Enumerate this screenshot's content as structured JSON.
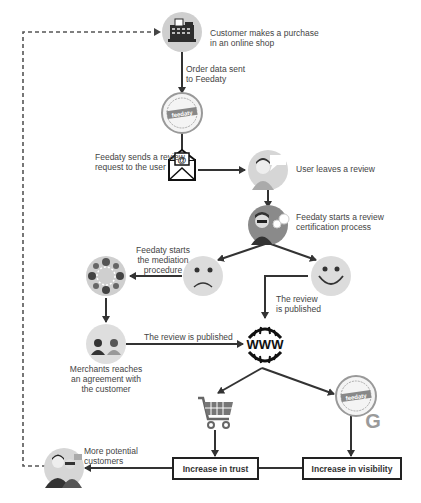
{
  "diagram": {
    "type": "flowchart",
    "nodes": {
      "purchase": {
        "label": "Customer makes a purchase\nin an online shop",
        "icon": "cash-register-icon"
      },
      "order_sent": {
        "label": "Order data sent\nto Feedaty"
      },
      "feedaty_seal_top": {
        "icon": "feedaty-certified-seal-icon",
        "seal_text": "feedaty"
      },
      "review_request": {
        "label": "Feedaty sends a review\nrequest to the user",
        "icon": "email-envelope-icon"
      },
      "user_review": {
        "label": "User leaves a review",
        "icon": "user-review-icon"
      },
      "certification": {
        "label": "Feedaty starts a review\ncertification process",
        "icon": "certification-gears-icon"
      },
      "mediation": {
        "label": "Feedaty starts\nthe mediation\nprocedure",
        "icon": "mediation-team-icon"
      },
      "sad": {
        "icon": "sad-face-icon"
      },
      "happy": {
        "icon": "happy-face-icon"
      },
      "published_right": {
        "label": "The review\nis published"
      },
      "published_left": {
        "label": "The review is published"
      },
      "merchants": {
        "label": "Merchants reaches\nan agreement with\nthe customer",
        "icon": "merchant-customer-icon"
      },
      "www": {
        "icon": "www-globe-icon",
        "text": "www"
      },
      "cart": {
        "icon": "shopping-cart-icon"
      },
      "feedaty_google": {
        "icon": "feedaty-google-seal-icon",
        "seal_text": "feedaty",
        "google_letter": "G"
      },
      "trust": {
        "label": "Increase in trust"
      },
      "visibility": {
        "label": "Increase in visibility"
      },
      "more_customers": {
        "label": "More potential\ncustomers",
        "icon": "customers-group-icon"
      }
    },
    "colors": {
      "line": "#333333",
      "dashed": "#555555",
      "circle_bg": "#d9d9d9",
      "text": "#444444",
      "google_gray": "#9a9a9a"
    }
  }
}
